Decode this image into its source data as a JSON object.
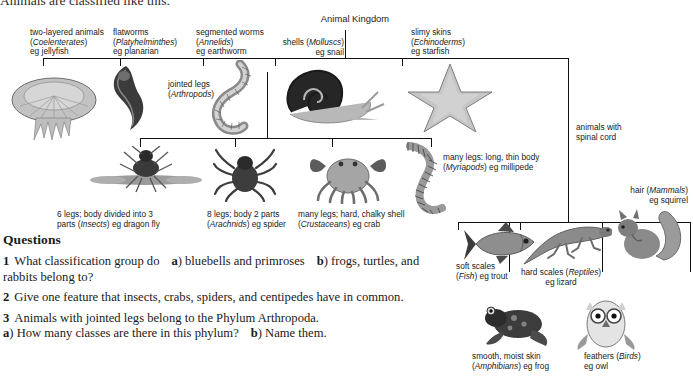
{
  "intro": {
    "text": "Animals are classified like this."
  },
  "diagram": {
    "root_label": "Animal Kingdom",
    "invertebrate_phyla": [
      {
        "id": "coelenterates",
        "line1": "two-layered animals",
        "line2_plain": "(",
        "line2_italic": "Coelenterates",
        "line2_end": ")",
        "line3": "eg jellyfish",
        "art": "jellyfish-illustration"
      },
      {
        "id": "platyhelminthes",
        "line1": "flatworms",
        "line2_plain": "(",
        "line2_italic": "Platyhelminthes",
        "line2_end": ")",
        "line3": "eg planarian",
        "art": "planarian-illustration"
      },
      {
        "id": "annelids",
        "line1": "segmented worms",
        "line2_plain": "(",
        "line2_italic": "Annelids",
        "line2_end": ")",
        "line3": "eg earthworm",
        "art": "earthworm-illustration"
      },
      {
        "id": "molluscs",
        "line1": "shells (",
        "line2_italic": "Molluscs",
        "line2_end": ")",
        "line3": "eg snail",
        "art": "snail-illustration"
      },
      {
        "id": "echinoderms",
        "line1": "slimy skins",
        "line2_plain": "(",
        "line2_italic": "Echinoderms",
        "line2_end": ")",
        "line3": "eg starfish",
        "art": "starfish-illustration"
      }
    ],
    "arthropod_node": {
      "line1": "jointed legs",
      "line2_italic": "Arthropods",
      "line2_open": "(",
      "line2_close": ")"
    },
    "arthropod_classes": [
      {
        "id": "insects",
        "line1": "6 legs; body divided into 3",
        "line2a": "parts (",
        "line2_italic": "Insects",
        "line2b": ") eg dragon fly",
        "art": "dragonfly-illustration"
      },
      {
        "id": "arachnids",
        "line1": "8 legs; body 2 parts",
        "line2a": "(",
        "line2_italic": "Arachnids",
        "line2b": ") eg spider",
        "art": "spider-illustration"
      },
      {
        "id": "crustaceans",
        "line1": "many legs; hard, chalky shell",
        "line2a": "(",
        "line2_italic": "Crustaceans",
        "line2b": ") eg crab",
        "art": "crab-illustration"
      },
      {
        "id": "myriapods",
        "line1": "many legs: long, thin body",
        "line2a": "(",
        "line2_italic": "Myriapods",
        "line2b": ") eg millipede",
        "art": "millipede-illustration"
      }
    ],
    "vertebrate_node": {
      "line1": "animals with",
      "line2": "spinal cord"
    },
    "vertebrate_classes": [
      {
        "id": "fish",
        "line1": "soft scales",
        "line2a": "(",
        "line2_italic": "Fish",
        "line2b": ") eg trout",
        "art": "trout-illustration"
      },
      {
        "id": "reptiles",
        "line1a": "hard scales (",
        "line1_italic": "Reptiles",
        "line1b": ")",
        "line2": "eg lizard",
        "art": "lizard-illustration"
      },
      {
        "id": "mammals",
        "line1a": "hair (",
        "line1_italic": "Mammals",
        "line1b": ")",
        "line2": "eg squirrel",
        "art": "squirrel-illustration"
      },
      {
        "id": "amphibians",
        "line1": "smooth, moist skin",
        "line2a": "(",
        "line2_italic": "Amphibians",
        "line2b": ") eg frog",
        "art": "frog-illustration"
      },
      {
        "id": "birds",
        "line1a": "feathers (",
        "line1_italic": "Birds",
        "line1b": ")",
        "line2": "eg owl",
        "art": "owl-illustration"
      }
    ]
  },
  "questions": {
    "heading": "Questions",
    "items": [
      {
        "number": "1",
        "part1": "What classification group do",
        "a_marker": "a",
        "a_text": ") bluebells and primroses",
        "b_marker": "b",
        "b_text": ") frogs,",
        "tail": "turtles, and rabbits belong to?"
      },
      {
        "number": "2",
        "text": "Give one feature that insects, crabs, spiders, and centipedes have in",
        "tail": "common."
      },
      {
        "number": "3",
        "text": "Animals with jointed legs belong to the Phylum Arthropoda.",
        "a_marker": "a",
        "a_text": ") How many classes are there in this phylum?",
        "b_marker": "b",
        "b_text": ") Name them."
      }
    ]
  },
  "colors": {
    "line": "#111111",
    "text": "#1a1a1a",
    "art_light": "#c9c9c9",
    "art_mid": "#8f8f8f",
    "art_dark": "#454545"
  }
}
